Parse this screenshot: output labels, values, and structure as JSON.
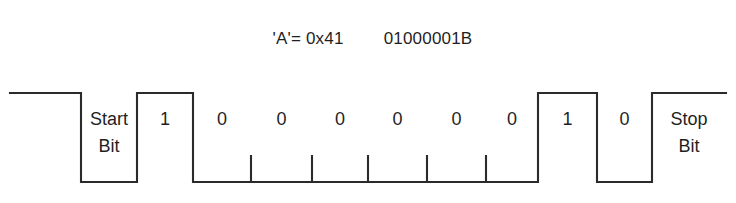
{
  "title": {
    "char_code": "'A'= 0x41",
    "binary": "01000001B"
  },
  "diagram": {
    "name": "uart-serial-frame-waveform",
    "line_color": "#2b2b2b",
    "background_color": "#ffffff",
    "high_level_y": 93,
    "low_level_y": 182,
    "idle_start_x": 10,
    "idle_end_x": 726,
    "bits": [
      {
        "label": "Start\nBit",
        "level": "low",
        "x_start": 81,
        "x_end": 137,
        "two_line": true
      },
      {
        "label": "1",
        "level": "high",
        "x_start": 137,
        "x_end": 193,
        "two_line": false
      },
      {
        "label": "0",
        "level": "low",
        "x_start": 193,
        "x_end": 251,
        "two_line": false
      },
      {
        "label": "0",
        "level": "low",
        "x_start": 251,
        "x_end": 312,
        "two_line": false
      },
      {
        "label": "0",
        "level": "low",
        "x_start": 312,
        "x_end": 368,
        "two_line": false
      },
      {
        "label": "0",
        "level": "low",
        "x_start": 368,
        "x_end": 427,
        "two_line": false
      },
      {
        "label": "0",
        "level": "low",
        "x_start": 427,
        "x_end": 486,
        "two_line": false
      },
      {
        "label": "0",
        "level": "low",
        "x_start": 486,
        "x_end": 538,
        "two_line": false
      },
      {
        "label": "1",
        "level": "high",
        "x_start": 538,
        "x_end": 597,
        "two_line": false
      },
      {
        "label": "0",
        "level": "low",
        "x_start": 597,
        "x_end": 652,
        "two_line": false
      },
      {
        "label": "Stop\nBit",
        "level": "high",
        "x_start": 652,
        "x_end": 726,
        "two_line": true
      }
    ],
    "tick_marks_x": [
      251,
      312,
      368,
      427,
      486
    ],
    "tick_height": 27
  }
}
